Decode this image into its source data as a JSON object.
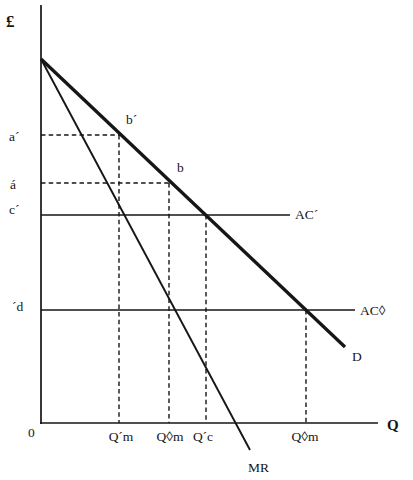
{
  "canvas": {
    "background": "#ffffff",
    "ink": "#161616"
  },
  "axes": {
    "y_axis": {
      "x1": 41,
      "y1": 5,
      "x2": 41,
      "y2": 424
    },
    "x_axis": {
      "x1": 40,
      "y1": 423,
      "x2": 378,
      "y2": 423
    }
  },
  "curves": {
    "demand": {
      "x1": 41,
      "y1": 59,
      "x2": 345,
      "y2": 347
    },
    "mr": {
      "x1": 41,
      "y1": 59,
      "x2": 250,
      "y2": 450
    },
    "ac_prime": {
      "x1": 41,
      "y1": 215,
      "x2": 290,
      "y2": 215
    },
    "ac_diamond": {
      "x1": 41,
      "y1": 310,
      "x2": 355,
      "y2": 310
    }
  },
  "guides": {
    "a_prime_h": {
      "x1": 41,
      "y1": 135,
      "x2": 120,
      "y2": 135
    },
    "a_acute_h": {
      "x1": 41,
      "y1": 183,
      "x2": 169,
      "y2": 183
    },
    "q_m_prime_v": {
      "x1": 119,
      "y1": 135,
      "x2": 119,
      "y2": 423
    },
    "q_m_diamond_v": {
      "x1": 169,
      "y1": 183,
      "x2": 169,
      "y2": 423
    },
    "q_c_prime_v": {
      "x1": 206,
      "y1": 215,
      "x2": 206,
      "y2": 423
    },
    "q_m_diamond2_v": {
      "x1": 306,
      "y1": 310,
      "x2": 306,
      "y2": 423
    }
  },
  "labels": {
    "pound": {
      "text": "£",
      "x": 6,
      "y": 27
    },
    "q": {
      "text": "Q",
      "x": 387,
      "y": 430
    },
    "zero": {
      "text": "0",
      "x": 28,
      "y": 437
    },
    "a_prime": {
      "text": "a´",
      "x": 9,
      "y": 141
    },
    "a_acute": {
      "text": "á",
      "x": 10,
      "y": 189
    },
    "c_prime": {
      "text": "c´",
      "x": 9,
      "y": 214
    },
    "d_prime": {
      "text": "´d",
      "x": 12,
      "y": 311
    },
    "b_prime": {
      "text": "b´",
      "x": 126,
      "y": 124
    },
    "b": {
      "text": "b",
      "x": 177,
      "y": 172
    },
    "demand": {
      "text": "D",
      "x": 352,
      "y": 361
    },
    "mr": {
      "text": "MR",
      "x": 248,
      "y": 472
    },
    "ac_prime": {
      "text": "AC´",
      "x": 295,
      "y": 219
    },
    "ac_diamond": {
      "text": "AC◊",
      "x": 360,
      "y": 315
    },
    "q_m_prime": {
      "text": "Q´m",
      "x": 121,
      "y": 441
    },
    "q_m_diamond": {
      "text": "Q◊m",
      "x": 170,
      "y": 441
    },
    "q_c_prime": {
      "text": "Q´c",
      "x": 203,
      "y": 441
    },
    "q_m_diamond2": {
      "text": "Q◊m",
      "x": 305,
      "y": 441
    }
  }
}
